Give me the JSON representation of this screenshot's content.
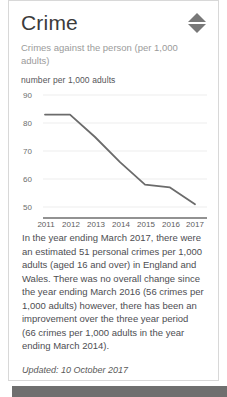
{
  "card": {
    "title": "Crime",
    "subtitle": "Crimes against the person (per 1,000 adults)",
    "sort_icon": "sort-diamond-icon"
  },
  "chart_data": {
    "type": "line",
    "title": "",
    "ylabel": "number per 1,000 adults",
    "xlabel": "",
    "categories": [
      "2011",
      "2012",
      "2013",
      "2014",
      "2015",
      "2016",
      "2017"
    ],
    "values": [
      83,
      83,
      75,
      66,
      58,
      57,
      51
    ],
    "series": [
      {
        "name": "Crimes against the person per 1,000 adults",
        "values": [
          83,
          83,
          75,
          66,
          58,
          57,
          51
        ]
      }
    ],
    "ylim": [
      45,
      92
    ],
    "yticks": [
      90,
      80,
      70,
      60,
      50
    ],
    "ytick_labels": [
      "90",
      "80",
      "70",
      "60",
      "50"
    ],
    "grid": true,
    "legend": false,
    "line_color": "#6b6b6b",
    "grid_color": "#ededed"
  },
  "body": {
    "paragraph": "In the year ending March 2017, there were an estimated 51 personal crimes per 1,000 adults (aged 16 and over) in England and Wales. There was no overall change since the year ending March 2016 (56 crimes per 1,000 adults) however, there has been an improvement over the three year period (66 crimes per 1,000 adults in the year ending March 2014).",
    "updated": "Updated: 10 October 2017"
  }
}
